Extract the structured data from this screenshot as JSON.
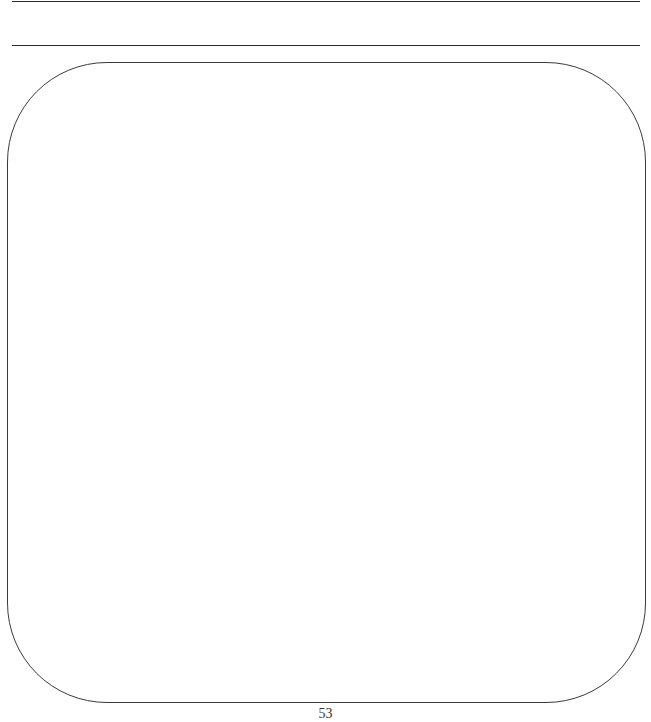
{
  "page": {
    "page_number": "53"
  },
  "colors": {
    "ink": "#2a2a2a",
    "background": "#ffffff"
  }
}
